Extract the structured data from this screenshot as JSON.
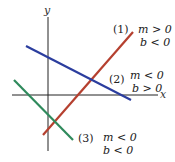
{
  "diagram": {
    "axes": {
      "x_label": "x",
      "y_label": "y",
      "color": "#222222"
    },
    "lines": [
      {
        "id": "1",
        "label": "(1)",
        "condition_m": "m > 0",
        "condition_b": "b < 0",
        "color": "#b5402f",
        "x1": 43,
        "y1": 135,
        "x2": 133,
        "y2": 32
      },
      {
        "id": "2",
        "label": "(2)",
        "condition_m": "m < 0",
        "condition_b": "b > 0",
        "color": "#2b3d9e",
        "x1": 26,
        "y1": 46,
        "x2": 131,
        "y2": 100
      },
      {
        "id": "3",
        "label": "(3)",
        "condition_m": "m < 0",
        "condition_b": "b < 0",
        "color": "#2f8a5c",
        "x1": 14,
        "y1": 80,
        "x2": 73,
        "y2": 140
      }
    ]
  }
}
